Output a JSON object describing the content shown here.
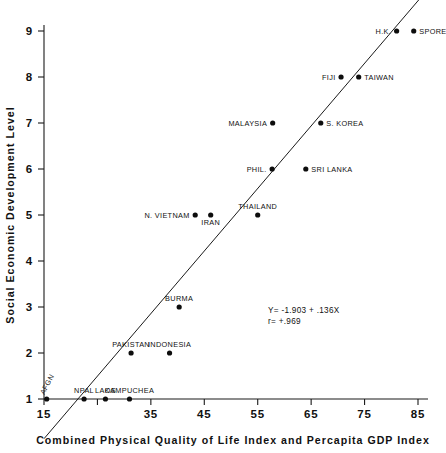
{
  "chart_data": {
    "type": "scatter",
    "title": "",
    "xlabel": "Combined Physical Quality of Life Index and Percapita GDP Index",
    "ylabel": "Social Economic Development Level",
    "xlim": [
      15,
      85
    ],
    "ylim": [
      1,
      9
    ],
    "grid": false,
    "legend": "none",
    "xticks": [
      15,
      25,
      35,
      45,
      55,
      65,
      75,
      85
    ],
    "xtick_labels": [
      "15",
      "",
      "35",
      "45",
      "55",
      "65",
      "75",
      "85"
    ],
    "yticks": [
      1,
      2,
      3,
      4,
      5,
      6,
      7,
      8,
      9
    ],
    "ytick_labels": [
      "1",
      "2",
      "3",
      "4",
      "5",
      "6",
      "7",
      "8",
      "9"
    ],
    "points": [
      {
        "label": "AFGN",
        "x": 15.5,
        "y": 1,
        "label_pos": "rot-left"
      },
      {
        "label": "NPAL",
        "x": 22.5,
        "y": 1,
        "label_pos": "above"
      },
      {
        "label": "LAOS",
        "x": 26.5,
        "y": 1,
        "label_pos": "above"
      },
      {
        "label": "KAMPUCHEA",
        "x": 31.0,
        "y": 1,
        "label_pos": "above"
      },
      {
        "label": "PAKISTAN",
        "x": 31.3,
        "y": 2,
        "label_pos": "above"
      },
      {
        "label": "INDONESIA",
        "x": 38.5,
        "y": 2,
        "label_pos": "above"
      },
      {
        "label": "BURMA",
        "x": 40.3,
        "y": 3,
        "label_pos": "above"
      },
      {
        "label": "N. VIETNAM",
        "x": 43.3,
        "y": 5,
        "label_pos": "left"
      },
      {
        "label": "IRAN",
        "x": 46.2,
        "y": 5,
        "label_pos": "below"
      },
      {
        "label": "THAILAND",
        "x": 55.0,
        "y": 5,
        "label_pos": "above"
      },
      {
        "label": "PHIL.",
        "x": 57.7,
        "y": 6,
        "label_pos": "left"
      },
      {
        "label": "SRI LANKA",
        "x": 64.0,
        "y": 6,
        "label_pos": "right"
      },
      {
        "label": "MALAYSIA",
        "x": 57.8,
        "y": 7,
        "label_pos": "left"
      },
      {
        "label": "S. KOREA",
        "x": 66.8,
        "y": 7,
        "label_pos": "right"
      },
      {
        "label": "FIJI",
        "x": 70.6,
        "y": 8,
        "label_pos": "left"
      },
      {
        "label": "TAIWAN",
        "x": 73.9,
        "y": 8,
        "label_pos": "right"
      },
      {
        "label": "H.K.",
        "x": 81.0,
        "y": 9,
        "label_pos": "left"
      },
      {
        "label": "SPORE",
        "x": 84.2,
        "y": 9,
        "label_pos": "right"
      }
    ],
    "fit": {
      "intercept": -1.903,
      "slope": 0.136,
      "equation_text": "Y= -1.903 + .136X",
      "correlation_text": "r= +.969",
      "correlation": 0.969
    }
  },
  "annotations": {
    "equation_line1": "Y= -1.903 + .136X",
    "equation_line2": "r= +.969"
  },
  "axes": {
    "x_title": "Combined Physical Quality of Life Index and Percapita GDP Index",
    "y_title": "Social Economic Development Level"
  }
}
